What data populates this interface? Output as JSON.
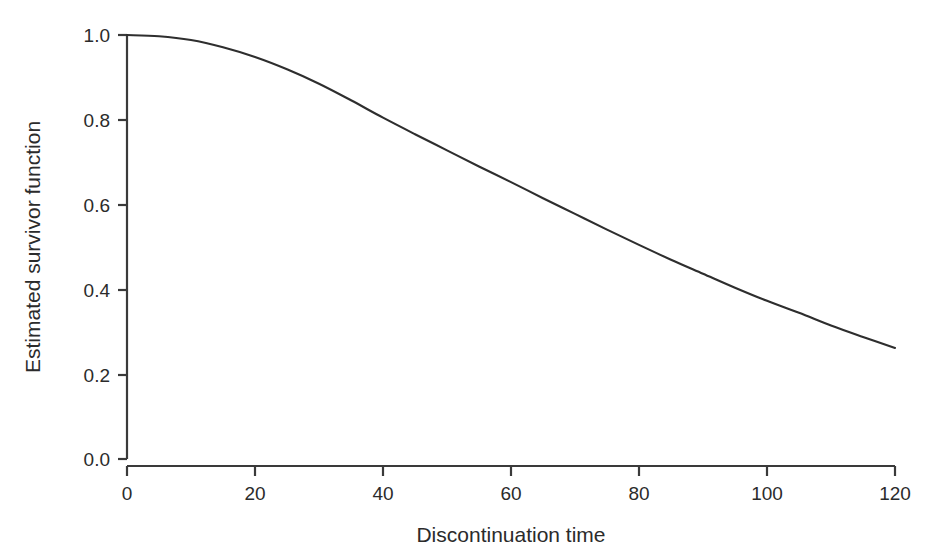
{
  "chart_data": {
    "type": "line",
    "title": "",
    "xlabel": "Discontinuation time",
    "ylabel": "Estimated survivor function",
    "xlim": [
      0,
      120
    ],
    "ylim": [
      0.0,
      1.0
    ],
    "xticks": [
      0,
      20,
      40,
      60,
      80,
      100,
      120
    ],
    "xtick_labels": [
      "0",
      "20",
      "40",
      "60",
      "80",
      "100",
      "120"
    ],
    "yticks": [
      0.0,
      0.2,
      0.4,
      0.6,
      0.8,
      1.0
    ],
    "ytick_labels": [
      "0.0",
      "0.2",
      "0.4",
      "0.6",
      "0.8",
      "1.0"
    ],
    "grid": false,
    "legend": false,
    "legend_position": "none",
    "line_color": "#2e2e2e",
    "axis_color": "#3a3a3a",
    "background_color": "#ffffff",
    "series": [
      {
        "name": "Estimated survivor function",
        "x": [
          0,
          5,
          10,
          15,
          20,
          25,
          30,
          35,
          40,
          45,
          50,
          55,
          60,
          65,
          70,
          75,
          80,
          85,
          90,
          95,
          100,
          105,
          110,
          115,
          120
        ],
        "values": [
          1.0,
          0.997,
          0.988,
          0.971,
          0.948,
          0.919,
          0.885,
          0.846,
          0.805,
          0.766,
          0.728,
          0.69,
          0.653,
          0.615,
          0.578,
          0.541,
          0.505,
          0.47,
          0.437,
          0.404,
          0.373,
          0.345,
          0.315,
          0.288,
          0.262
        ]
      }
    ]
  },
  "axes": {
    "x_axis_label": "Discontinuation time",
    "y_axis_label": "Estimated survivor function"
  },
  "ticks": {
    "x": [
      {
        "label": "0",
        "value": 0
      },
      {
        "label": "20",
        "value": 20
      },
      {
        "label": "40",
        "value": 40
      },
      {
        "label": "60",
        "value": 60
      },
      {
        "label": "80",
        "value": 80
      },
      {
        "label": "100",
        "value": 100
      },
      {
        "label": "120",
        "value": 120
      }
    ],
    "y": [
      {
        "label": "0.0",
        "value": 0.0
      },
      {
        "label": "0.2",
        "value": 0.2
      },
      {
        "label": "0.4",
        "value": 0.4
      },
      {
        "label": "0.6",
        "value": 0.6
      },
      {
        "label": "0.8",
        "value": 0.8
      },
      {
        "label": "1.0",
        "value": 1.0
      }
    ]
  }
}
